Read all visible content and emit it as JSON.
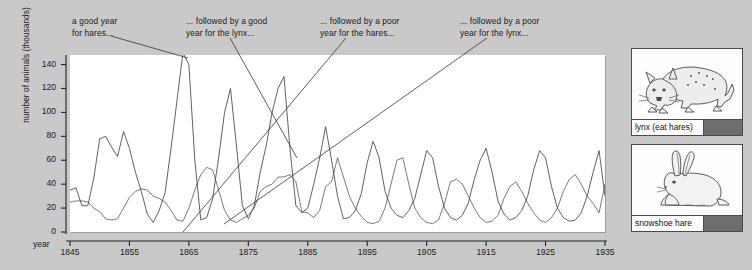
{
  "figure": {
    "background_color": "#c9c9c9",
    "plot_background_color": "#ffffff",
    "line_color": "#3a3a3a"
  },
  "annotations": [
    {
      "id": "ann-good-year-hares",
      "text": "a good year\nfor hares...",
      "x": 72,
      "y": 16
    },
    {
      "id": "ann-good-year-lynx",
      "text": "... followed by a good\nyear for the lynx...",
      "x": 186,
      "y": 16
    },
    {
      "id": "ann-poor-year-hares",
      "text": "... followed by a poor\nyear for the hares...",
      "x": 320,
      "y": 16
    },
    {
      "id": "ann-poor-year-lynx",
      "text": "... followed by a poor\nyear for the lynx...",
      "x": 460,
      "y": 16
    }
  ],
  "axes": {
    "year_label": "year",
    "ylabel": "number of animals (thousands)",
    "yticks": [
      0,
      20,
      40,
      60,
      80,
      100,
      120,
      140
    ],
    "xticks": [
      1845,
      1855,
      1865,
      1875,
      1885,
      1895,
      1905,
      1915,
      1925,
      1935
    ]
  },
  "legend": {
    "items": [
      {
        "name": "lynx (eat hares)",
        "icon": "lynx-illustration",
        "swatch_color": "#6e6e6e"
      },
      {
        "name": "snowshoe hare",
        "icon": "hare-illustration",
        "swatch_color": "#6e6e6e"
      }
    ]
  },
  "chart_data": {
    "type": "line",
    "title": "",
    "xlabel": "year",
    "ylabel": "number of animals (thousands)",
    "xlim": [
      1845,
      1935
    ],
    "ylim": [
      0,
      148
    ],
    "grid": false,
    "legend_position": "right",
    "x": [
      1845,
      1846,
      1847,
      1848,
      1849,
      1850,
      1851,
      1852,
      1853,
      1854,
      1855,
      1856,
      1857,
      1858,
      1859,
      1860,
      1861,
      1862,
      1863,
      1864,
      1865,
      1866,
      1867,
      1868,
      1869,
      1870,
      1871,
      1872,
      1873,
      1874,
      1875,
      1876,
      1877,
      1878,
      1879,
      1880,
      1881,
      1882,
      1883,
      1884,
      1885,
      1886,
      1887,
      1888,
      1889,
      1890,
      1891,
      1892,
      1893,
      1894,
      1895,
      1896,
      1897,
      1898,
      1899,
      1900,
      1901,
      1902,
      1903,
      1904,
      1905,
      1906,
      1907,
      1908,
      1909,
      1910,
      1911,
      1912,
      1913,
      1914,
      1915,
      1916,
      1917,
      1918,
      1919,
      1920,
      1921,
      1922,
      1923,
      1924,
      1925,
      1926,
      1927,
      1928,
      1929,
      1930,
      1931,
      1932,
      1933,
      1934,
      1935
    ],
    "series": [
      {
        "name": "snowshoe hare",
        "values": [
          35,
          37,
          22,
          22,
          45,
          78,
          80,
          71,
          63,
          84,
          70,
          50,
          34,
          15,
          8,
          18,
          33,
          70,
          110,
          150,
          140,
          60,
          10,
          12,
          28,
          62,
          100,
          120,
          72,
          22,
          11,
          22,
          50,
          72,
          100,
          120,
          130,
          70,
          22,
          16,
          20,
          40,
          62,
          88,
          60,
          30,
          11,
          12,
          18,
          32,
          58,
          76,
          62,
          34,
          20,
          14,
          12,
          18,
          28,
          48,
          68,
          62,
          38,
          20,
          12,
          10,
          14,
          24,
          44,
          60,
          70,
          50,
          26,
          15,
          10,
          12,
          18,
          30,
          52,
          68,
          62,
          38,
          20,
          12,
          9,
          10,
          16,
          30,
          50,
          68,
          30
        ]
      },
      {
        "name": "lynx (eat hares)",
        "values": [
          25,
          26,
          26,
          25,
          20,
          17,
          11,
          10,
          11,
          20,
          29,
          34,
          36,
          35,
          30,
          28,
          25,
          18,
          10,
          9,
          20,
          35,
          48,
          54,
          52,
          35,
          18,
          10,
          8,
          11,
          14,
          20,
          34,
          38,
          40,
          46,
          46,
          48,
          42,
          17,
          16,
          12,
          18,
          38,
          42,
          62,
          46,
          30,
          20,
          13,
          8,
          7,
          9,
          20,
          40,
          60,
          62,
          40,
          20,
          12,
          8,
          7,
          10,
          24,
          42,
          44,
          40,
          30,
          20,
          12,
          8,
          9,
          14,
          28,
          38,
          42,
          34,
          24,
          16,
          10,
          8,
          12,
          20,
          34,
          44,
          48,
          40,
          30,
          24,
          16,
          40
        ]
      }
    ]
  },
  "leader_lines": [
    {
      "id": "leader-1",
      "x1": 111,
      "y1": 36,
      "x2": 188,
      "y2": 58
    },
    {
      "id": "leader-2",
      "x1": 230,
      "y1": 38,
      "x2": 297,
      "y2": 158
    },
    {
      "id": "leader-3",
      "x1": 346,
      "y1": 38,
      "x2": 183,
      "y2": 232
    },
    {
      "id": "leader-4",
      "x1": 487,
      "y1": 38,
      "x2": 224,
      "y2": 224
    }
  ]
}
